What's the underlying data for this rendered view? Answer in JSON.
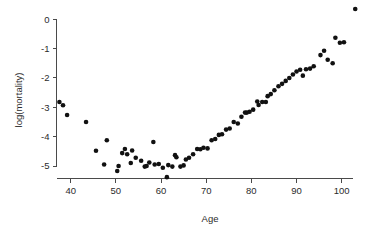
{
  "chart_data": {
    "type": "scatter",
    "title": "",
    "subtitle": "",
    "xlabel": "Age",
    "ylabel": "log(mortality)",
    "xlim": [
      36,
      105
    ],
    "ylim": [
      -5.75,
      0.6
    ],
    "grid": false,
    "legend": null,
    "xticks": [
      40,
      50,
      60,
      70,
      80,
      90,
      100
    ],
    "xtick_labels": [
      "40",
      "50",
      "60",
      "70",
      "80",
      "90",
      "100"
    ],
    "yticks": [
      0,
      -1,
      -2,
      -3,
      -4,
      -5
    ],
    "ytick_labels": [
      "0",
      "-1",
      "-2",
      "-3",
      "-4",
      "-5"
    ],
    "marker": {
      "shape": "circle",
      "color": "#111111",
      "size_px": 2.3
    },
    "axis_color": "#4a4a4a",
    "background_color": "#ffffff",
    "series": [
      {
        "name": "log(mortality)",
        "x": [
          37.5,
          38.3,
          39.2,
          43.4,
          45.6,
          47.4,
          48.0,
          50.3,
          50.6,
          51.4,
          52.0,
          52.5,
          53.3,
          53.6,
          54.4,
          55.6,
          56.4,
          56.8,
          57.4,
          58.3,
          58.6,
          59.5,
          60.4,
          61.3,
          61.6,
          62.5,
          63.1,
          63.4,
          64.3,
          65.0,
          65.5,
          66.2,
          67.1,
          68.0,
          68.7,
          69.4,
          70.3,
          71.2,
          72.0,
          72.8,
          73.5,
          74.4,
          75.2,
          76.1,
          77.0,
          77.8,
          78.6,
          79.0,
          79.6,
          80.4,
          81.3,
          81.6,
          82.4,
          83.2,
          83.6,
          84.3,
          85.1,
          86.0,
          86.8,
          87.6,
          88.4,
          89.2,
          90.0,
          90.8,
          91.4,
          92.1,
          93.0,
          93.8,
          95.3,
          96.1,
          96.9,
          98.0,
          98.6,
          99.6,
          100.5,
          103.0
        ],
        "y": [
          -2.82,
          -2.93,
          -3.26,
          -3.5,
          -4.48,
          -4.95,
          -4.12,
          -5.17,
          -5.0,
          -4.56,
          -4.42,
          -4.6,
          -4.9,
          -4.47,
          -4.72,
          -4.82,
          -5.02,
          -5.0,
          -4.88,
          -4.18,
          -4.95,
          -4.93,
          -5.06,
          -5.38,
          -4.97,
          -5.02,
          -4.63,
          -4.7,
          -5.02,
          -4.98,
          -4.78,
          -4.72,
          -4.6,
          -4.42,
          -4.43,
          -4.38,
          -4.4,
          -4.12,
          -4.08,
          -3.94,
          -3.92,
          -3.76,
          -3.72,
          -3.5,
          -3.55,
          -3.32,
          -3.18,
          -3.18,
          -3.15,
          -3.08,
          -2.8,
          -2.92,
          -2.82,
          -2.82,
          -2.62,
          -2.55,
          -2.42,
          -2.28,
          -2.2,
          -2.1,
          -2.0,
          -1.88,
          -1.78,
          -1.72,
          -1.92,
          -1.7,
          -1.68,
          -1.6,
          -1.22,
          -1.07,
          -1.38,
          -1.5,
          -0.63,
          -0.8,
          -0.78,
          0.35
        ]
      }
    ]
  },
  "axis_labels": {
    "x_title": "Age",
    "y_title": "log(mortality)"
  }
}
